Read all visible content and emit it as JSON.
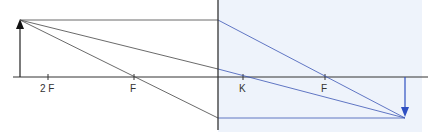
{
  "diagram": {
    "labels": {
      "two_f_left": "2 F",
      "f_left": "F",
      "k_right": "K",
      "f_right": "F"
    },
    "colors": {
      "line": "#333333",
      "ray_after_lens": "#3b55b5",
      "image_region_bg": "#eef3fb",
      "image_arrow": "#2e4fc2"
    }
  }
}
